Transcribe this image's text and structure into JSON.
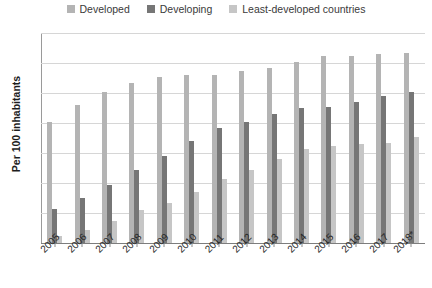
{
  "chart_data": {
    "type": "bar",
    "title": "",
    "subtitle": "",
    "xlabel": "",
    "ylabel": "Per 100 inhabitants",
    "ylim": [
      0,
      140
    ],
    "ytick_step": 20,
    "yticks": [
      "140",
      "120",
      "100",
      "80",
      "60",
      "40",
      "20",
      "0"
    ],
    "grid": true,
    "legend_position": "top-center",
    "categories": [
      "2005",
      "2006",
      "2007",
      "2008",
      "2009",
      "2010",
      "2011",
      "2012",
      "2013",
      "2014",
      "2015",
      "2016",
      "2017",
      "2018*"
    ],
    "series": [
      {
        "name": "Developed",
        "color": "#b4b4b4",
        "values": [
          81,
          92,
          101,
          107,
          111,
          112,
          112,
          115,
          117,
          121,
          125,
          125,
          126,
          127
        ]
      },
      {
        "name": "Developing",
        "color": "#767676",
        "values": [
          23,
          30,
          39,
          49,
          58,
          68,
          77,
          81,
          86,
          90,
          91,
          94,
          98,
          101
        ]
      },
      {
        "name": "Least-developed countries",
        "color": "#c6c6c6",
        "values": [
          5,
          9,
          15,
          22,
          27,
          34,
          43,
          49,
          56,
          63,
          65,
          66,
          67,
          71
        ]
      }
    ]
  }
}
